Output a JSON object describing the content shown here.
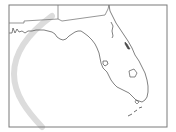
{
  "map": {
    "region": "Florida",
    "frame": {
      "x": 9,
      "y": 5,
      "width": 158,
      "height": 122,
      "stroke": "#7a7a7a"
    },
    "colors": {
      "background": "#ffffff",
      "coastline": "#4a4a4a",
      "border": "#6a6a6a",
      "track": "#dcdcdc",
      "lake": "#555555"
    },
    "track": {
      "path": "M52 16 C 30 32, 14 52, 14 74 C 14 95, 28 112, 42 127",
      "width": 6
    },
    "state_borders": [
      "M9 23 L24 23 L24 21 L58 19 L58 5",
      "M58 19 L62 21 L105 15 L108 9 L109 5"
    ],
    "coastline": "M9 33 L12 33 L13 28 L15 33 L17 29 L19 32 L22 31 L25 33 L28 31 L32 31 L36 30 L40 30 L44 30 L48 31 L52 32 L55 34 L57 37 L60 39 L63 40 L66 39 L69 36 L72 34 L75 32 L78 31 L81 31 L84 33 L88 36 L92 40 L95 44 L97 48 L99 53 L100 58 L101 63 L103 68 L107 72 L109 76 L111 80 L114 84 L117 87 L121 89 L125 91 L129 93 L133 97 L136 100 L139 101 L142 102 L145 100 L147 97 L148 92 L148 86 L147 80 L145 73 L142 67 L139 61 L135 55 L132 48 L128 41 L124 35 L120 29 L116 23 L113 17 L110 11 L109 5",
    "features": {
      "lake_okeechobee": "M129 71 L134 69 L137 73 L135 77 L130 77 Z",
      "tampa_bay": "M103 61 L107 61 L108 64 L105 66 L103 64 Z",
      "indian_river": "M125 42 L127 44 L130 49 L128 49 L125 44 Z",
      "st_johns": "M111 22 L113 26 L112 31 L113 36 L112 38",
      "keys": "M128 116 L132 114 M134 112 L137 110 M139 108 L142 107",
      "miami_area": "M136 100 L139 102 L137 104 L135 102 Z"
    }
  }
}
